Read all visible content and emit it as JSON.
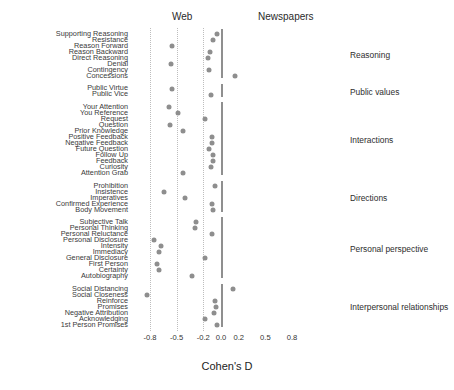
{
  "header": {
    "left_label": "Web",
    "right_label": "Newspapers"
  },
  "axis": {
    "title": "Cohen's D",
    "ticks": [
      "-0.8",
      "-0.5",
      "-0.2",
      "0.0",
      "0.2",
      "0.5",
      "0.8"
    ],
    "tick_values": [
      -0.8,
      -0.5,
      -0.2,
      0.0,
      0.2,
      0.5,
      0.8
    ],
    "xlim": [
      -1.0,
      1.0
    ],
    "gridlines": [
      -0.8,
      -0.5,
      -0.2
    ],
    "zero_line": 0.0
  },
  "groups": [
    {
      "name": "Reasoning",
      "label": "Reasoning"
    },
    {
      "name": "Public values",
      "label": "Public values"
    },
    {
      "name": "Interactions",
      "label": "Interactions"
    },
    {
      "name": "Directions",
      "label": "Directions"
    },
    {
      "name": "Personal perspective",
      "label": "Personal perspective"
    },
    {
      "name": "Interpersonal relationships",
      "label": "Interpersonal relationships"
    }
  ],
  "chart_data": {
    "type": "scatter",
    "title": "",
    "xlabel": "Cohen's D",
    "ylabel": "",
    "xlim": [
      -1.0,
      1.0
    ],
    "grid": true,
    "legend": "none",
    "orientation": "horizontal-dotplot",
    "annotations": [
      "Web",
      "Newspapers"
    ],
    "note": "Negative Cohen's D favours Web, positive favours Newspapers",
    "groups": [
      {
        "group": "Reasoning",
        "points": [
          {
            "label": "Supporting Reasoning",
            "value": -0.04
          },
          {
            "label": "Resistance",
            "value": -0.09
          },
          {
            "label": "Reason Forward",
            "value": -0.55
          },
          {
            "label": "Reason Backward",
            "value": -0.12
          },
          {
            "label": "Direct Reasoning",
            "value": -0.15
          },
          {
            "label": "Denial",
            "value": -0.56
          },
          {
            "label": "Contingency",
            "value": -0.14
          },
          {
            "label": "Concessions",
            "value": 0.16
          }
        ]
      },
      {
        "group": "Public values",
        "points": [
          {
            "label": "Public Virtue",
            "value": -0.55
          },
          {
            "label": "Public Vice",
            "value": -0.11
          }
        ]
      },
      {
        "group": "Interactions",
        "points": [
          {
            "label": "Your Attention",
            "value": -0.59
          },
          {
            "label": "You Reference",
            "value": -0.49
          },
          {
            "label": "Request",
            "value": -0.18
          },
          {
            "label": "Question",
            "value": -0.57
          },
          {
            "label": "Prior Knowledge",
            "value": -0.43
          },
          {
            "label": "Positive Feedback",
            "value": -0.1
          },
          {
            "label": "Negative Feedback",
            "value": -0.1
          },
          {
            "label": "Future Question",
            "value": -0.13
          },
          {
            "label": "Follow Up",
            "value": -0.09
          },
          {
            "label": "Feedback",
            "value": -0.09
          },
          {
            "label": "Curiosity",
            "value": -0.11
          },
          {
            "label": "Attention Grab",
            "value": -0.43
          }
        ]
      },
      {
        "group": "Directions",
        "points": [
          {
            "label": "Prohibition",
            "value": -0.07
          },
          {
            "label": "Insistence",
            "value": -0.64
          },
          {
            "label": "Imperatives",
            "value": -0.41
          },
          {
            "label": "Confirmed Experience",
            "value": -0.1
          },
          {
            "label": "Body Movement",
            "value": -0.09
          }
        ]
      },
      {
        "group": "Personal perspective",
        "points": [
          {
            "label": "Subjective Talk",
            "value": -0.28
          },
          {
            "label": "Personal Thinking",
            "value": -0.29
          },
          {
            "label": "Personal Reluctance",
            "value": -0.1
          },
          {
            "label": "Personal Disclosure",
            "value": -0.76
          },
          {
            "label": "Intensity",
            "value": -0.68
          },
          {
            "label": "Immediacy",
            "value": -0.7
          },
          {
            "label": "General Disclosure",
            "value": -0.18
          },
          {
            "label": "First Person",
            "value": -0.72
          },
          {
            "label": "Certainty",
            "value": -0.7
          },
          {
            "label": "Autobiography",
            "value": -0.33
          }
        ]
      },
      {
        "group": "Interpersonal relationships",
        "points": [
          {
            "label": "Social Distancing",
            "value": 0.13
          },
          {
            "label": "Social Closeness",
            "value": -0.83
          },
          {
            "label": "Reinforce",
            "value": -0.07
          },
          {
            "label": "Promises",
            "value": -0.06
          },
          {
            "label": "Negative Attribution",
            "value": -0.08
          },
          {
            "label": "Acknowledging",
            "value": -0.18
          },
          {
            "label": "1st Person Promises",
            "value": -0.05
          }
        ]
      }
    ]
  }
}
